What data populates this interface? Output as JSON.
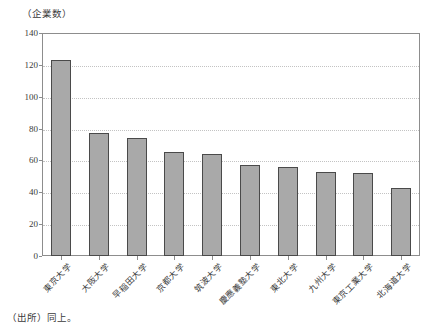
{
  "chart_data": {
    "type": "bar",
    "title": "",
    "subtitle": "",
    "xlabel": "",
    "ylabel": "（企業数）",
    "ylim": [
      0,
      140
    ],
    "ytick_step": 20,
    "yticks": [
      "0",
      "20",
      "40",
      "60",
      "80",
      "100",
      "120",
      "140"
    ],
    "grid": true,
    "legend": null,
    "categories": [
      "東京大学",
      "大阪大学",
      "早稲田大学",
      "京都大学",
      "筑波大学",
      "慶應義塾大学",
      "東北大学",
      "九州大学",
      "東京工業大学",
      "北海道大学"
    ],
    "values": [
      123,
      77,
      74,
      65,
      64,
      57,
      56,
      53,
      52,
      43
    ],
    "bar_fill_color": "#a9a9a9",
    "bar_border_color": "#4a4a4a",
    "grid_color": "#c3c3c3",
    "axis_color": "#8d8d8d",
    "text_color": "#3a3a3a"
  },
  "figure": {
    "y_axis_unit": "（企業数）",
    "source_note": "（出所）同上。"
  }
}
